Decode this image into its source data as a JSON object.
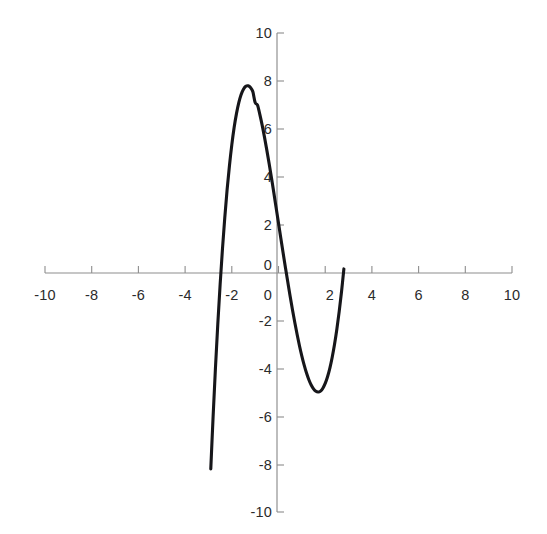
{
  "chart_data": {
    "type": "line",
    "title": "",
    "subtitle": "",
    "xlabel": "",
    "ylabel": "",
    "xlim": [
      -10,
      10
    ],
    "ylim": [
      -10,
      10
    ],
    "grid": false,
    "legend": null,
    "annotations": [],
    "x_ticks": [
      -10,
      -8,
      -6,
      -4,
      -2,
      0,
      2,
      4,
      6,
      8,
      10
    ],
    "x_tick_labels": [
      "-10",
      "-8",
      "-6",
      "-4",
      "-2",
      "0",
      "2",
      "4",
      "6",
      "8",
      "10"
    ],
    "y_ticks": [
      -10,
      -8,
      -6,
      -4,
      -2,
      0,
      2,
      4,
      6,
      8,
      10
    ],
    "y_tick_labels": [
      "-10",
      "-8",
      "-6",
      "-4",
      "-2",
      "0",
      "2",
      "4",
      "6",
      "8",
      "10"
    ],
    "series": [
      {
        "name": "cubic",
        "color": "#16161a",
        "expression": "y = x^3 - 0.4x^2 - 5.5x + 4",
        "x": [
          -2.9,
          -2.8,
          -2.7,
          -2.6,
          -2.5,
          -2.4,
          -2.3,
          -2.2,
          -2.1,
          -2.0,
          -1.9,
          -1.8,
          -1.7,
          -1.6,
          -1.5,
          -1.4,
          -1.3,
          -1.2,
          -1.1,
          -1.0,
          -0.9,
          -0.8,
          -0.7,
          -0.6,
          -0.5,
          -0.4,
          -0.3,
          -0.2,
          -0.1,
          0.0,
          0.1,
          0.2,
          0.3,
          0.4,
          0.5,
          0.6,
          0.7,
          0.8,
          0.9,
          1.0,
          1.1,
          1.2,
          1.3,
          1.4,
          1.5,
          1.6,
          1.7,
          1.8,
          1.9,
          2.0,
          2.1,
          2.2,
          2.3,
          2.4,
          2.5,
          2.6,
          2.7,
          2.8
        ],
        "y": [
          -8.16,
          -5.97,
          -3.96,
          -2.13,
          -0.48,
          1.0,
          2.32,
          3.48,
          4.48,
          5.34,
          6.06,
          6.64,
          7.1,
          7.44,
          7.66,
          7.78,
          7.8,
          7.73,
          7.56,
          7.1,
          7.0,
          6.61,
          6.16,
          5.66,
          5.12,
          4.55,
          3.96,
          3.34,
          2.71,
          2.08,
          1.45,
          0.82,
          0.21,
          -0.39,
          -0.98,
          -1.54,
          -2.07,
          -2.57,
          -3.04,
          -3.46,
          -3.84,
          -4.17,
          -4.45,
          -4.67,
          -4.83,
          -4.93,
          -4.96,
          -4.92,
          -4.8,
          -4.6,
          -4.32,
          -3.96,
          -3.51,
          -2.97,
          -2.33,
          -1.6,
          -0.77,
          0.17
        ]
      }
    ],
    "features": {
      "y_intercept": 4.0,
      "local_maximum": {
        "x": -1.5,
        "y": 9.7
      },
      "local_minimum": {
        "x": 1.6,
        "y": -1.6
      },
      "roots": [
        -2.6,
        0.85,
        2.15
      ]
    }
  },
  "axes": {
    "x_axis_name": "horizontal-axis",
    "y_axis_name": "vertical-axis"
  }
}
